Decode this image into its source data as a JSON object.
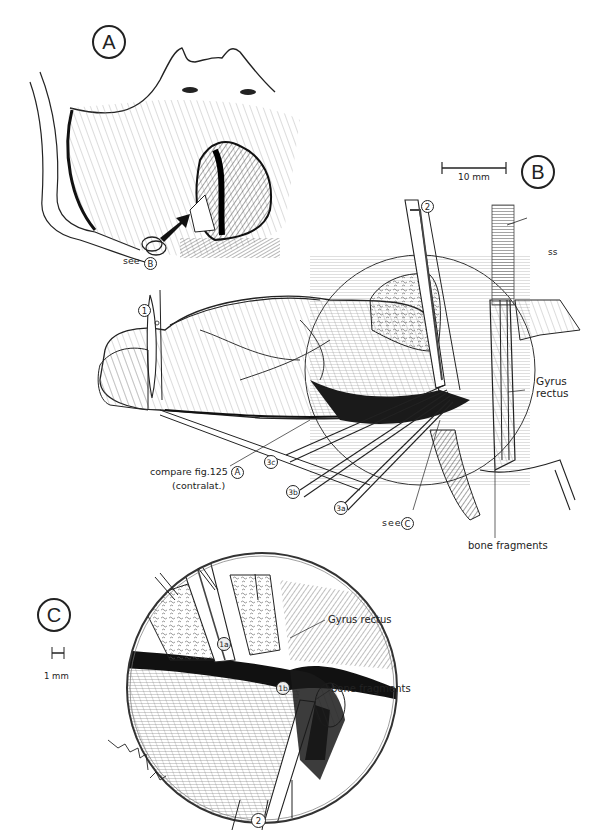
{
  "figure": {
    "panels": [
      {
        "id": "A",
        "label": "A"
      },
      {
        "id": "B",
        "label": "B"
      },
      {
        "id": "C",
        "label": "C"
      }
    ],
    "panel_a": {
      "see_label": "see",
      "see_ref": "B"
    },
    "panel_b": {
      "scale_bar": "10 mm",
      "instrument_labels": {
        "n1": "1",
        "n2": "2",
        "n3a": "3a",
        "n3b": "3b",
        "n3c": "3c"
      },
      "annotations": {
        "ss": "ss",
        "gyrus_rectus_line1": "Gyrus",
        "gyrus_rectus_line2": "rectus",
        "bone_fragments": "bone fragments",
        "compare_line1": "compare fig.125",
        "compare_ref": "A",
        "compare_line2": "(contralat.)",
        "see_label": "see",
        "see_ref": "C"
      }
    },
    "panel_c": {
      "scale_bar": "1 mm",
      "instrument_labels": {
        "n1a": "1a",
        "n1b": "1b",
        "n2": "2"
      },
      "annotations": {
        "gyrus_rectus": "Gyrus rectus",
        "bone_fragments": "bone fragments"
      },
      "signature": "signature"
    },
    "colors": {
      "ink": "#222222",
      "background": "#ffffff",
      "shade": "#555555"
    }
  }
}
